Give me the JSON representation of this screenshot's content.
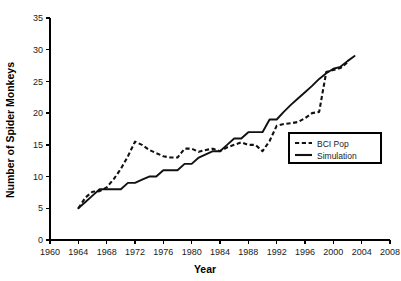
{
  "chart_data": {
    "type": "line",
    "title": "",
    "xlabel": "Year",
    "ylabel": "Number of Spider Monkeys",
    "xlim": [
      1960,
      2008
    ],
    "ylim": [
      0,
      35
    ],
    "xticks": [
      1960,
      1964,
      1968,
      1972,
      1976,
      1980,
      1984,
      1988,
      1992,
      1996,
      2000,
      2004,
      2008
    ],
    "yticks": [
      0,
      5,
      10,
      15,
      20,
      25,
      30,
      35
    ],
    "grid": false,
    "legend_position": "center-right",
    "series": [
      {
        "name": "BCI Pop",
        "style": "dashed",
        "color": "#111111",
        "x": [
          1964,
          1965,
          1966,
          1967,
          1968,
          1969,
          1970,
          1971,
          1972,
          1973,
          1974,
          1975,
          1976,
          1977,
          1978,
          1979,
          1980,
          1981,
          1982,
          1983,
          1984,
          1985,
          1986,
          1987,
          1988,
          1989,
          1990,
          1991,
          1992,
          1993,
          1994,
          1995,
          1996,
          1997,
          1998,
          1999,
          2000,
          2001,
          2002
        ],
        "values": [
          5.0,
          6.7,
          7.6,
          7.7,
          8.3,
          9.6,
          11.2,
          13.2,
          15.5,
          15.0,
          14.2,
          13.7,
          13.2,
          13.0,
          13.0,
          14.4,
          14.4,
          13.9,
          14.2,
          14.4,
          14.0,
          14.6,
          15.0,
          15.4,
          15.0,
          15.0,
          14.0,
          15.6,
          18.0,
          18.3,
          18.4,
          18.6,
          19.2,
          20.0,
          20.2,
          26.5,
          26.8,
          27.1,
          28.0
        ]
      },
      {
        "name": "Simulation",
        "style": "solid",
        "color": "#111111",
        "x": [
          1964,
          1965,
          1966,
          1967,
          1968,
          1969,
          1970,
          1971,
          1972,
          1973,
          1974,
          1975,
          1976,
          1977,
          1978,
          1979,
          1980,
          1981,
          1982,
          1983,
          1984,
          1985,
          1986,
          1987,
          1988,
          1989,
          1990,
          1991,
          1992,
          1993,
          1994,
          1995,
          1996,
          1997,
          1998,
          1999,
          2000,
          2001,
          2002,
          2003
        ],
        "values": [
          5.0,
          6.0,
          7.0,
          8.0,
          8.0,
          8.0,
          8.0,
          9.0,
          9.0,
          9.5,
          10.0,
          10.0,
          11.0,
          11.0,
          11.0,
          12.0,
          12.0,
          13.0,
          13.5,
          14.0,
          14.0,
          15.0,
          16.0,
          16.0,
          17.0,
          17.0,
          17.0,
          19.0,
          19.0,
          20.2,
          21.3,
          22.3,
          23.3,
          24.3,
          25.4,
          26.3,
          27.0,
          27.3,
          28.2,
          29.0
        ]
      }
    ]
  },
  "legend": {
    "entries": [
      {
        "label": "BCI Pop",
        "style": "dashed"
      },
      {
        "label": "Simulation",
        "style": "solid"
      }
    ]
  }
}
